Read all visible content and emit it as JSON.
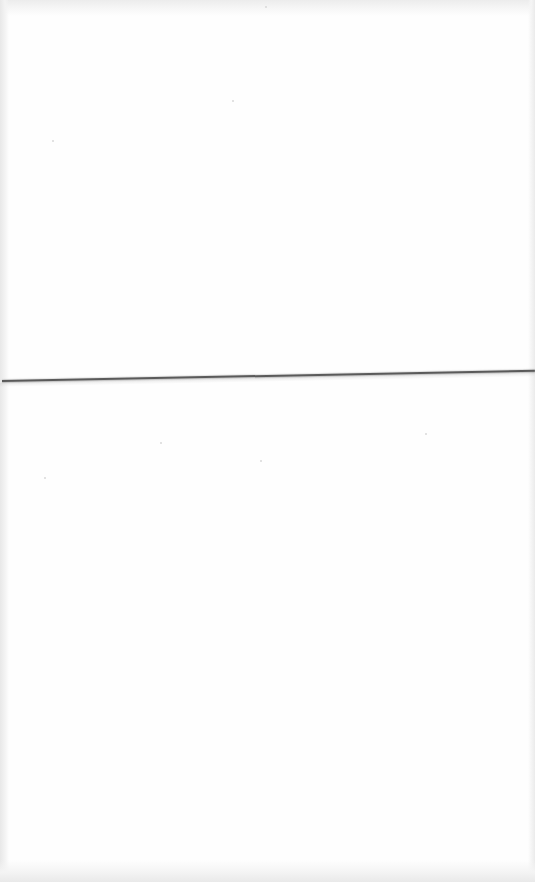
{
  "document": {
    "type": "scanned-blank-page",
    "background_color": "#fefefe",
    "sections": [
      {
        "name": "upper-half",
        "text": ""
      },
      {
        "name": "lower-half",
        "text": ""
      }
    ],
    "divider": {
      "color": "#5a5a5a",
      "left_y": 381,
      "right_y": 370
    }
  }
}
